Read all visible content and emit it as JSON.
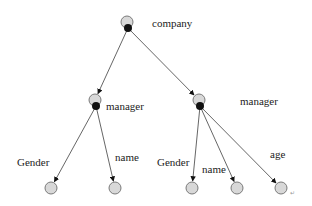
{
  "diagram": {
    "type": "tree",
    "colors": {
      "node_fill": "#d8d8d8",
      "node_stroke": "#7a7a7a",
      "joint_fill": "#111111",
      "edge": "#555555",
      "text": "#222222"
    },
    "nodes": [
      {
        "id": "company",
        "label": "company",
        "x": 127,
        "y": 22,
        "joint": true,
        "label_x": 152,
        "label_y": 27
      },
      {
        "id": "manager1",
        "label": "manager",
        "x": 95,
        "y": 100,
        "joint": true,
        "label_x": 106,
        "label_y": 110
      },
      {
        "id": "manager2",
        "label": "manager",
        "x": 199,
        "y": 100,
        "joint": true,
        "label_x": 240,
        "label_y": 105
      },
      {
        "id": "gender1",
        "label": "Gender",
        "x": 51,
        "y": 188,
        "joint": false,
        "label_x": 17,
        "label_y": 166
      },
      {
        "id": "name1",
        "label": "name",
        "x": 115,
        "y": 188,
        "joint": false,
        "label_x": 115,
        "label_y": 161
      },
      {
        "id": "gender2",
        "label": "Gender",
        "x": 192,
        "y": 188,
        "joint": false,
        "label_x": 157,
        "label_y": 166
      },
      {
        "id": "name2",
        "label": "name",
        "x": 237,
        "y": 188,
        "joint": false,
        "label_x": 202,
        "label_y": 173
      },
      {
        "id": "age",
        "label": "age",
        "x": 281,
        "y": 188,
        "joint": false,
        "label_x": 270,
        "label_y": 158
      }
    ],
    "edges": [
      {
        "from": "company",
        "to": "manager1"
      },
      {
        "from": "company",
        "to": "manager2"
      },
      {
        "from": "manager1",
        "to": "gender1"
      },
      {
        "from": "manager1",
        "to": "name1"
      },
      {
        "from": "manager2",
        "to": "gender2"
      },
      {
        "from": "manager2",
        "to": "name2"
      },
      {
        "from": "manager2",
        "to": "age"
      }
    ],
    "trailing_mark": "↵"
  }
}
